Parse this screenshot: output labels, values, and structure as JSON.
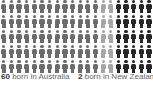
{
  "chart_data": {
    "type": "pictogram",
    "title": "",
    "rows": 5,
    "columns": 20,
    "unit": "person",
    "groups": [
      {
        "name": "born in Australia",
        "count": 60,
        "color": "#6b6b6b",
        "visible_columns": [
          0,
          13
        ]
      },
      {
        "name": "other (partially visible, lighter grey)",
        "color": "#a6a6a6",
        "visible_columns": [
          13,
          15
        ]
      },
      {
        "name": "born in New Zealand",
        "count": 2,
        "color": "#262626",
        "visible_columns": [
          15,
          20
        ]
      }
    ],
    "legend": [
      {
        "value": "60",
        "label": "born in Australia"
      },
      {
        "value": "2",
        "label": "born in New Zealand"
      }
    ]
  },
  "colors": {
    "grey": "#6b6b6b",
    "light_grey": "#a6a6a6",
    "black": "#262626",
    "text": "#666666",
    "value_text": "#333333"
  },
  "labels": [
    {
      "value": "60",
      "text": "born in Australia"
    },
    {
      "value": "2",
      "text": "born in New Zealand"
    }
  ]
}
